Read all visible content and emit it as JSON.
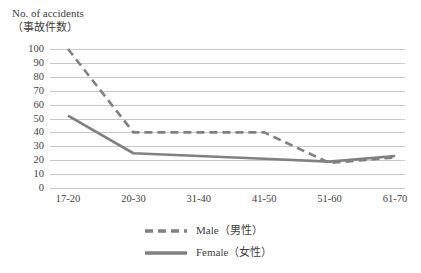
{
  "chart_data": {
    "type": "line",
    "title": "",
    "ylabel_lines": [
      "No. of accidents",
      "（事故件数）"
    ],
    "xlabel": "",
    "categories": [
      "17-20",
      "20-30",
      "31-40",
      "41-50",
      "51-60",
      "61-70"
    ],
    "series": [
      {
        "name": "Male（男性）",
        "style": "dashed",
        "color": "#808080",
        "values": [
          100,
          40,
          40,
          40,
          18,
          22
        ]
      },
      {
        "name": "Female（女性）",
        "style": "solid",
        "color": "#808080",
        "values": [
          52,
          25,
          23,
          21,
          19,
          23
        ]
      }
    ],
    "ylim": [
      0,
      100
    ],
    "ytick_values": [
      100,
      90,
      80,
      70,
      60,
      50,
      40,
      30,
      20,
      10,
      0
    ],
    "ytick_labels": [
      "100",
      "90",
      "80",
      "70",
      "60",
      "50",
      "40",
      "30",
      "20",
      "10",
      "0"
    ],
    "grid": true,
    "grid_color": "#c9c9c9",
    "legend_position": "bottom",
    "legend": [
      {
        "label": "Male（男性）",
        "style": "dashed",
        "color": "#808080"
      },
      {
        "label": "Female（女性）",
        "style": "solid",
        "color": "#808080"
      }
    ]
  }
}
